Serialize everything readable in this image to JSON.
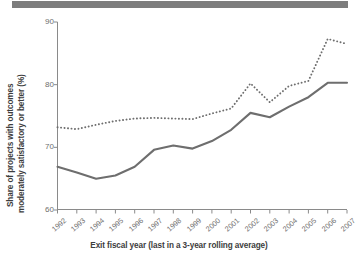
{
  "figure": {
    "top_bar_color": "#7d7d7d",
    "background_color": "#ffffff"
  },
  "chart_data": {
    "type": "line",
    "title": "",
    "xlabel": "Exit fiscal year (last in a 3-year rolling average)",
    "ylabel": "Share of projects with outcomes moderately satisfactory or better (%)",
    "ylabel_line1": "Share of projects with outcomes",
    "ylabel_line2": "moderately satisfactory or better (%)",
    "categories": [
      "1992",
      "1993",
      "1994",
      "1995",
      "1996",
      "1997",
      "1998",
      "1999",
      "2000",
      "2001",
      "2002",
      "2003",
      "2004",
      "2005",
      "2006",
      "2007"
    ],
    "x": [
      1992,
      1993,
      1994,
      1995,
      1996,
      1997,
      1998,
      1999,
      2000,
      2001,
      2002,
      2003,
      2004,
      2005,
      2006,
      2007
    ],
    "ylim": [
      60,
      90
    ],
    "xlim": [
      1992,
      2007
    ],
    "yticks": [
      60,
      70,
      80,
      90
    ],
    "ytick_labels": [
      "60",
      "70",
      "80",
      "90"
    ],
    "grid": false,
    "legend": "none",
    "series": [
      {
        "name": "dotted-series",
        "style": "dotted",
        "color": "#6e6e6e",
        "values": [
          73.2,
          72.9,
          73.6,
          74.2,
          74.6,
          74.7,
          74.6,
          74.5,
          75.4,
          76.2,
          80.2,
          77.2,
          79.8,
          80.6,
          87.3,
          86.5
        ]
      },
      {
        "name": "solid-series",
        "style": "solid",
        "color": "#6e6e6e",
        "values": [
          66.9,
          66.0,
          65.0,
          65.5,
          66.9,
          69.6,
          70.3,
          69.8,
          71.0,
          72.8,
          75.5,
          74.8,
          76.5,
          78.0,
          80.3,
          80.3
        ]
      }
    ]
  }
}
